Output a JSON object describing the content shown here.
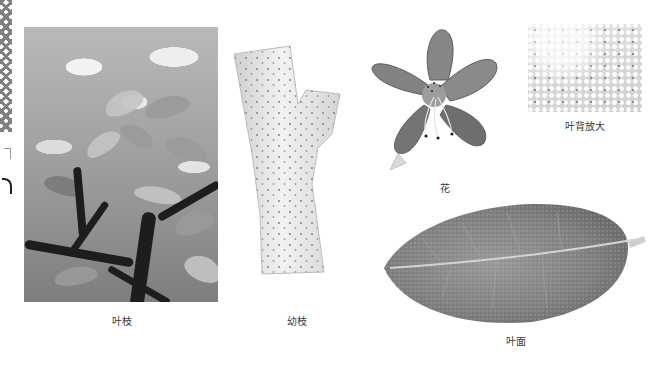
{
  "page": {
    "background": "#ffffff"
  },
  "figures": [
    {
      "id": "leaf-branch",
      "label": "叶枝",
      "kind": "photo"
    },
    {
      "id": "young-twig",
      "label": "幼枝",
      "kind": "photo"
    },
    {
      "id": "flower",
      "label": "花",
      "kind": "photo"
    },
    {
      "id": "leaf-back-magnified",
      "label": "叶背放大",
      "kind": "photo"
    },
    {
      "id": "leaf-upper",
      "label": "叶面",
      "kind": "photo"
    }
  ],
  "colors": {
    "tone": "grayscale",
    "caption_text": "#3a3a3a",
    "trunk": "#1d1d1d"
  }
}
